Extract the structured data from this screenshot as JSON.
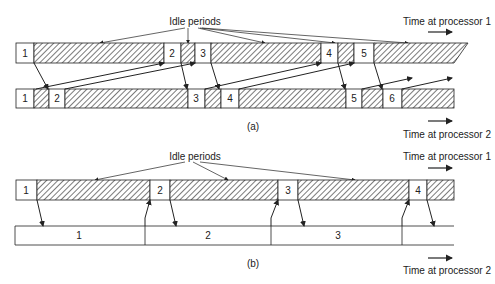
{
  "colors": {
    "ink": "#222222",
    "hatch": "#333333",
    "background": "#ffffff"
  },
  "panel_a": {
    "caption": "(a)",
    "idle_label": "Idle periods",
    "time_label_p1": "Time at processor 1",
    "time_label_p2": "Time at processor 2",
    "processor1_tasks": [
      "1",
      "2",
      "3",
      "4",
      "5"
    ],
    "processor2_tasks": [
      "1",
      "2",
      "3",
      "4",
      "5",
      "6"
    ]
  },
  "panel_b": {
    "caption": "(b)",
    "idle_label": "Idle periods",
    "time_label_p1": "Time at processor 1",
    "time_label_p2": "Time at processor 2",
    "processor1_tasks": [
      "1",
      "2",
      "3",
      "4"
    ],
    "processor2_tasks": [
      "1",
      "2",
      "3"
    ]
  }
}
